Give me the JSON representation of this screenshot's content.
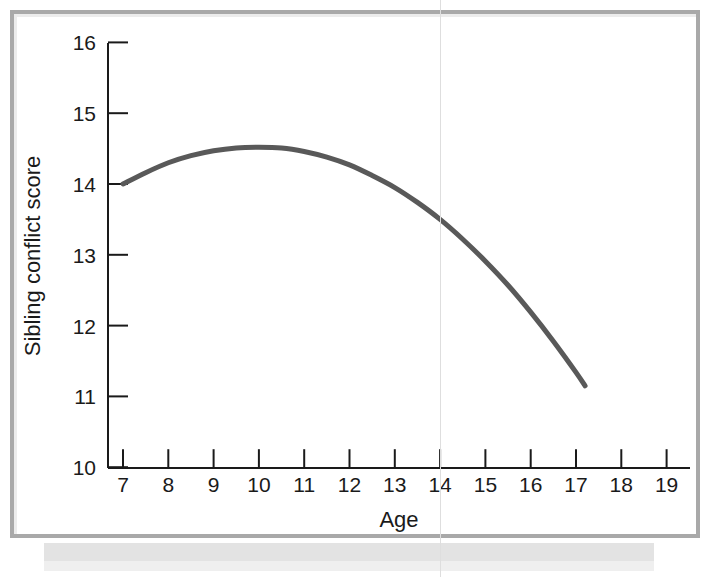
{
  "figure": {
    "kind": "line-chart-plate",
    "background_color": "#ffffff",
    "frame_color": "#a9a9a9",
    "band_color": "#e3e3e3",
    "seam_color": "#dedede"
  },
  "chart_data": {
    "type": "line",
    "title": "",
    "subtitle": "",
    "xlabel": "Age",
    "ylabel": "Sibling conflict score",
    "xlim": [
      6.5,
      19.5
    ],
    "ylim": [
      10,
      16
    ],
    "xticks": [
      7,
      8,
      9,
      10,
      11,
      12,
      13,
      14,
      15,
      16,
      17,
      18,
      19
    ],
    "xtick_labels": [
      "7",
      "8",
      "9",
      "10",
      "11",
      "12",
      "13",
      "14",
      "15",
      "16",
      "17",
      "18",
      "19"
    ],
    "yticks": [
      10,
      11,
      12,
      13,
      14,
      15,
      16
    ],
    "ytick_labels": [
      "10",
      "11",
      "12",
      "13",
      "14",
      "15",
      "16"
    ],
    "grid": false,
    "legend": null,
    "legend_position": "none",
    "series": [
      {
        "name": "Sibling conflict score",
        "color": "#595959",
        "line_width": 5,
        "x": [
          7.0,
          7.5,
          8.0,
          8.5,
          9.0,
          9.5,
          10.0,
          10.5,
          11.0,
          11.5,
          12.0,
          12.5,
          13.0,
          13.5,
          14.0,
          14.5,
          15.0,
          15.5,
          16.0,
          16.5,
          17.0,
          17.2
        ],
        "values": [
          14.0,
          14.16,
          14.3,
          14.4,
          14.47,
          14.51,
          14.52,
          14.51,
          14.46,
          14.38,
          14.27,
          14.12,
          13.95,
          13.74,
          13.5,
          13.22,
          12.91,
          12.57,
          12.19,
          11.78,
          11.34,
          11.15
        ]
      }
    ],
    "annotations": [
      {
        "name": "peak",
        "x": 10.3,
        "y": 14.52,
        "note": "curve maximum"
      },
      {
        "name": "start",
        "x": 7.0,
        "y": 14.0,
        "note": "curve start"
      },
      {
        "name": "end",
        "x": 17.2,
        "y": 11.15,
        "note": "curve end"
      }
    ]
  }
}
